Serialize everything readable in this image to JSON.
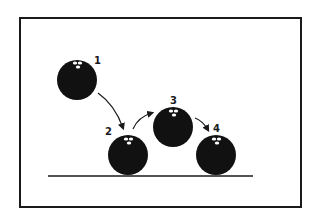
{
  "diagram": {
    "type": "bouncing-ball-sequence",
    "colors": {
      "ball": "#111111",
      "highlight": "#ffffff",
      "line": "#1a1a1a",
      "frame": "#1a1a1a",
      "background": "#ffffff"
    },
    "balls": [
      {
        "label": "1",
        "cx": 77,
        "cy": 80,
        "r": 20
      },
      {
        "label": "2",
        "cx": 128,
        "cy": 155,
        "r": 20
      },
      {
        "label": "3",
        "cx": 173,
        "cy": 127,
        "r": 20
      },
      {
        "label": "4",
        "cx": 216,
        "cy": 155,
        "r": 20
      }
    ],
    "ground": {
      "x1": 48,
      "x2": 253,
      "y": 176
    }
  }
}
